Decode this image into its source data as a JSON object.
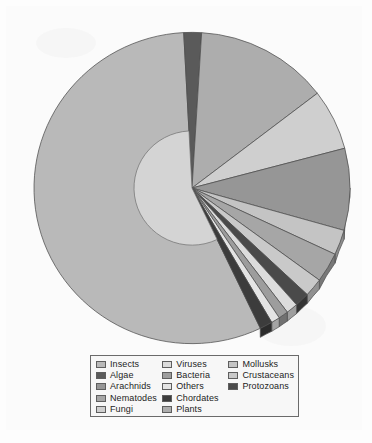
{
  "figure": {
    "background_color": "#fbfbfb",
    "paper_color": "#fdfdfd"
  },
  "legend": {
    "border_color": "#6a6a6a",
    "background_color": "#f7f7f7",
    "columns": [
      {
        "items": [
          {
            "label": "Insects",
            "color": "#b9b9b9"
          },
          {
            "label": "Algae",
            "color": "#5a5a5a"
          },
          {
            "label": "Arachnids",
            "color": "#969696"
          },
          {
            "label": "Nematodes",
            "color": "#a6a6a6"
          },
          {
            "label": "Fungi",
            "color": "#cfcfcf"
          }
        ]
      },
      {
        "items": [
          {
            "label": "Viruses",
            "color": "#dcdcdc"
          },
          {
            "label": "Bacteria",
            "color": "#9d9d9d"
          },
          {
            "label": "Others",
            "color": "#e4e4e4"
          },
          {
            "label": "Chordates",
            "color": "#3c3c3c"
          },
          {
            "label": "Plants",
            "color": "#adadad"
          }
        ]
      },
      {
        "items": [
          {
            "label": "Mollusks",
            "color": "#c4c4c4"
          },
          {
            "label": "Crustaceans",
            "color": "#c9c9c9"
          },
          {
            "label": "Protozoans",
            "color": "#4a4a4a"
          }
        ]
      }
    ]
  },
  "chart_data": {
    "type": "pie",
    "title": "",
    "subtitle": "",
    "xlabel": "",
    "ylabel": "",
    "legend_position": "bottom",
    "grid": false,
    "style": "3d-exploded-grayscale",
    "start_angle_deg": 90,
    "direction": "clockwise",
    "center_px": {
      "x": 186,
      "y": 182
    },
    "radius_px": 158,
    "depth_px": 9,
    "inner_highlight_radius_px": 58,
    "labels": [
      "Insects",
      "Plants",
      "Arachnids",
      "Fungi",
      "Nematodes",
      "Mollusks",
      "Crustaceans",
      "Algae",
      "Protozoans",
      "Chordates",
      "Viruses",
      "Bacteria",
      "Others"
    ],
    "values": [
      56.3,
      13.6,
      8.5,
      6.3,
      3.1,
      2.6,
      1.9,
      1.8,
      1.5,
      1.3,
      1.2,
      1.0,
      0.9
    ],
    "unit": "percent",
    "slices": [
      {
        "label": "Insects",
        "value": 56.3,
        "color": "#b9b9b9",
        "start_deg": 93.0,
        "end_deg": 295.7
      },
      {
        "label": "Algae",
        "value": 1.8,
        "color": "#5a5a5a",
        "start_deg": 86.5,
        "end_deg": 93.0
      },
      {
        "label": "Plants",
        "value": 13.6,
        "color": "#adadad",
        "start_deg": 37.5,
        "end_deg": 86.5
      },
      {
        "label": "Fungi",
        "value": 6.3,
        "color": "#cfcfcf",
        "start_deg": 14.8,
        "end_deg": 37.5
      },
      {
        "label": "Arachnids",
        "value": 8.5,
        "color": "#969696",
        "start_deg": -15.8,
        "end_deg": 14.8
      },
      {
        "label": "Mollusks",
        "value": 2.6,
        "color": "#c4c4c4",
        "start_deg": -25.2,
        "end_deg": -15.8
      },
      {
        "label": "Nematodes",
        "value": 3.1,
        "color": "#a6a6a6",
        "start_deg": -36.3,
        "end_deg": -25.2
      },
      {
        "label": "Crustaceans",
        "value": 1.9,
        "color": "#c9c9c9",
        "start_deg": -43.2,
        "end_deg": -36.3
      },
      {
        "label": "Protozoans",
        "value": 1.5,
        "color": "#4a4a4a",
        "start_deg": -48.6,
        "end_deg": -43.2
      },
      {
        "label": "Viruses",
        "value": 1.2,
        "color": "#dcdcdc",
        "start_deg": -52.9,
        "end_deg": -48.6
      },
      {
        "label": "Bacteria",
        "value": 1.0,
        "color": "#9d9d9d",
        "start_deg": -56.5,
        "end_deg": -52.9
      },
      {
        "label": "Others",
        "value": 0.9,
        "color": "#e4e4e4",
        "start_deg": -59.7,
        "end_deg": -56.5
      },
      {
        "label": "Chordates",
        "value": 1.3,
        "color": "#3c3c3c",
        "start_deg": -64.4,
        "end_deg": -59.7
      }
    ]
  }
}
